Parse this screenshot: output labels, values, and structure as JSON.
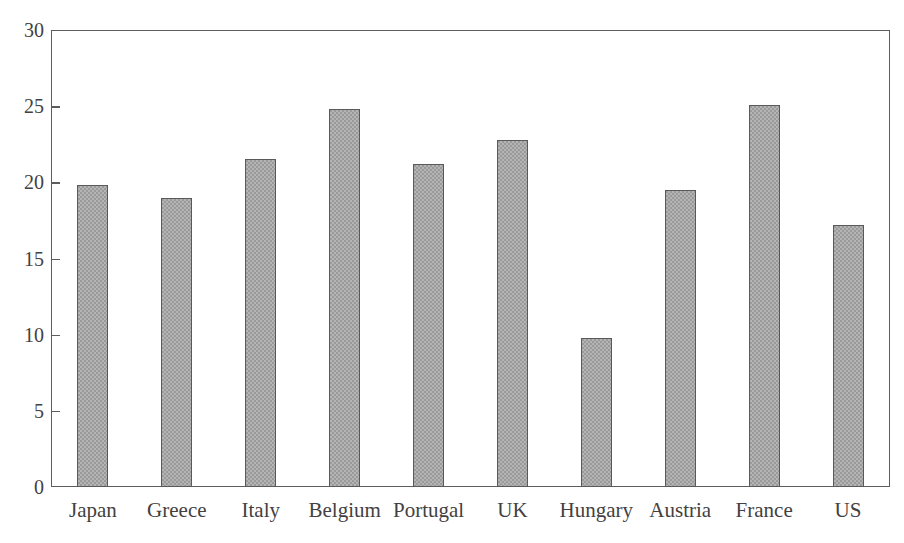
{
  "chart_data": {
    "type": "bar",
    "title": "",
    "xlabel": "",
    "ylabel": "",
    "categories": [
      "Japan",
      "Greece",
      "Italy",
      "Belgium",
      "Portugal",
      "UK",
      "Hungary",
      "Austria",
      "France",
      "US"
    ],
    "values": [
      19.8,
      19.0,
      21.5,
      24.8,
      21.2,
      22.8,
      9.8,
      19.5,
      25.1,
      17.2
    ],
    "ylim": [
      0,
      30
    ],
    "yticks": [
      0,
      5,
      10,
      15,
      20,
      25,
      30
    ],
    "ytick_labels": [
      "0",
      "5",
      "10",
      "15",
      "20",
      "25",
      "30"
    ],
    "grid": false,
    "legend": null,
    "bar_fill_color": "#9a9a9a",
    "bar_edge_color": "#5a5a5a",
    "axis_color": "#5f5d5c",
    "text_color": "#43413f",
    "background_color": "#ffffff"
  }
}
